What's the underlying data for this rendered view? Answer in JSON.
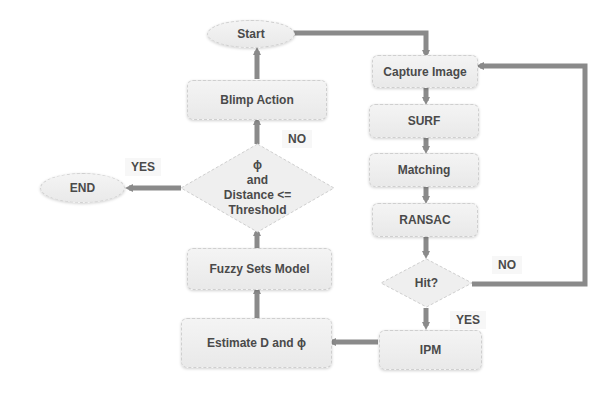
{
  "diagram": {
    "type": "flowchart",
    "nodes": {
      "start": "Start",
      "blimp_action": "Blimp Action",
      "decision_line1": "ϕ",
      "decision_line2": "and",
      "decision_line3": "Distance <=",
      "decision_line4": "Threshold",
      "end": "END",
      "fuzzy": "Fuzzy Sets Model",
      "estimate": "Estimate D and ϕ",
      "capture": "Capture Image",
      "surf": "SURF",
      "matching": "Matching",
      "ransac": "RANSAC",
      "hit": "Hit?",
      "ipm": "IPM"
    },
    "labels": {
      "no_top": "NO",
      "yes_left": "YES",
      "no_right": "NO",
      "yes_bottom": "YES"
    },
    "colors": {
      "arrow": "#8a8a8a",
      "node_fill": "#efefef",
      "text": "#4a4a4a"
    }
  }
}
